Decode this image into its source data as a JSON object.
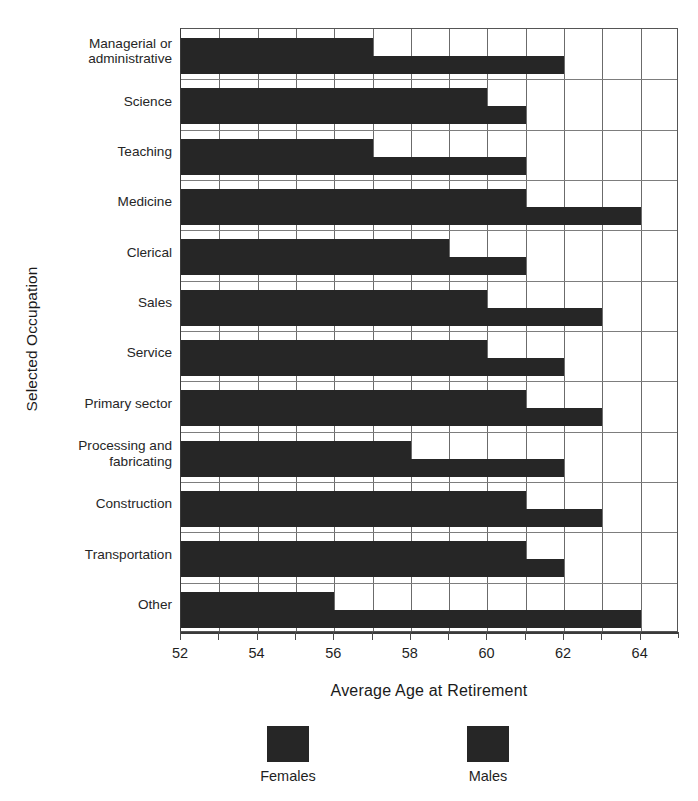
{
  "chart_data": {
    "type": "bar",
    "orientation": "horizontal",
    "title": "",
    "xlabel": "Average Age at Retirement",
    "ylabel": "Selected Occupation",
    "xlim": [
      52,
      65
    ],
    "xticks": [
      52,
      53,
      54,
      55,
      56,
      57,
      58,
      59,
      60,
      61,
      62,
      63,
      64
    ],
    "xtick_labels": [
      "52",
      "",
      "54",
      "",
      "56",
      "",
      "58",
      "",
      "60",
      "",
      "62",
      "",
      "64"
    ],
    "grid": "vertical-and-group-separators",
    "legend_position": "bottom",
    "categories": [
      "Managerial or administrative",
      "Science",
      "Teaching",
      "Medicine",
      "Clerical",
      "Sales",
      "Service",
      "Primary sector",
      "Processing and fabricating",
      "Construction",
      "Transportation",
      "Other"
    ],
    "category_lines": [
      [
        "Managerial or",
        "administrative"
      ],
      [
        "Science"
      ],
      [
        "Teaching"
      ],
      [
        "Medicine"
      ],
      [
        "Clerical"
      ],
      [
        "Sales"
      ],
      [
        "Service"
      ],
      [
        "Primary sector"
      ],
      [
        "Processing and",
        "fabricating"
      ],
      [
        "Construction"
      ],
      [
        "Transportation"
      ],
      [
        "Other"
      ]
    ],
    "series": [
      {
        "name": "Females",
        "color": "#262626",
        "values": [
          57,
          60,
          57,
          61,
          59,
          60,
          60,
          61,
          58,
          61,
          61,
          56
        ]
      },
      {
        "name": "Males",
        "color": "#262626",
        "values": [
          62,
          61,
          61,
          64,
          61,
          63,
          62,
          63,
          62,
          63,
          62,
          64
        ]
      }
    ]
  },
  "legend": {
    "entries": [
      {
        "label": "Females",
        "color": "#262626"
      },
      {
        "label": "Males",
        "color": "#262626"
      }
    ]
  },
  "axes": {
    "x_title": "Average Age at Retirement",
    "y_title": "Selected Occupation"
  }
}
